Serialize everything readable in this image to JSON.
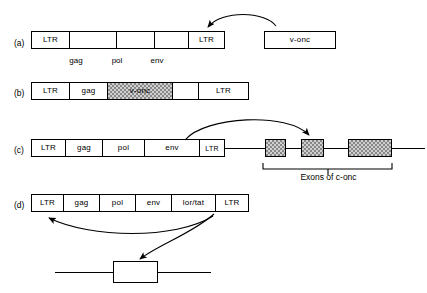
{
  "figure": {
    "background_color": "#ffffff",
    "line_color": "#000000",
    "hatch_fill_color": "#cfcfcf"
  },
  "rows": {
    "a": {
      "label": "(a)",
      "genome_segments": [
        {
          "text": "LTR",
          "under": ""
        },
        {
          "text": "",
          "under": "gag"
        },
        {
          "text": "",
          "under": "pol"
        },
        {
          "text": "",
          "under": "env"
        },
        {
          "text": "LTR",
          "under": ""
        }
      ],
      "under_labels": [
        "gag",
        "pol",
        "env"
      ],
      "side_box": {
        "text": "v-onc"
      },
      "arrow_note": "curved arrow from v-onc box to right LTR"
    },
    "b": {
      "label": "(b)",
      "genome_segments": [
        {
          "text": "LTR",
          "fill": "plain"
        },
        {
          "text": "gag",
          "fill": "plain"
        },
        {
          "text": "v-onc",
          "fill": "hatched"
        },
        {
          "text": "",
          "fill": "plain"
        },
        {
          "text": "LTR",
          "fill": "plain"
        }
      ]
    },
    "c": {
      "label": "(c)",
      "genome_segments": [
        {
          "text": "LTR"
        },
        {
          "text": "gag"
        },
        {
          "text": "pol"
        },
        {
          "text": "env"
        },
        {
          "text": "LTR"
        }
      ],
      "exons": [
        {
          "name": "exon-1"
        },
        {
          "name": "exon-2"
        },
        {
          "name": "exon-3"
        }
      ],
      "bracket_caption": "Exons of c-onc",
      "arrow_note": "curved arrow from provirus LTR to middle c-onc exon"
    },
    "d": {
      "label": "(d)",
      "genome_segments": [
        {
          "text": "LTR"
        },
        {
          "text": "gag"
        },
        {
          "text": "pol"
        },
        {
          "text": "env"
        },
        {
          "text": "lor/tat"
        },
        {
          "text": "LTR"
        }
      ],
      "target_box": {
        "text": ""
      },
      "arrow_notes": [
        "curved arrow from lor/tat region back to left LTR",
        "curved arrow from lor/tat region down to cellular target gene box"
      ]
    }
  }
}
